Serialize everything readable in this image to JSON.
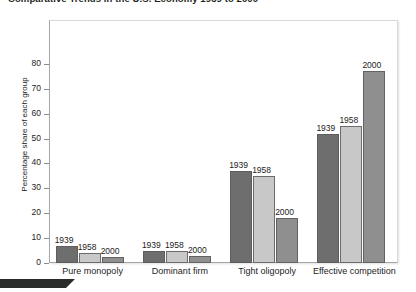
{
  "chart_data": {
    "type": "bar",
    "title": "Comparative Trends in the U.S. Economy 1939 to 2000",
    "xlabel": "",
    "ylabel": "Percentage share of each group",
    "categories": [
      "Pure monopoly",
      "Dominant firm",
      "Tight oligopoly",
      "Effective competition"
    ],
    "series": [
      {
        "name": "1939",
        "values": [
          7,
          5,
          37,
          52
        ],
        "color": "#6e6e6e"
      },
      {
        "name": "1958",
        "values": [
          4,
          5,
          35,
          55
        ],
        "color": "#c8c8c8"
      },
      {
        "name": "2000",
        "values": [
          2.5,
          3,
          18,
          77
        ],
        "color": "#8f8f8f"
      }
    ],
    "ylim": [
      0,
      85
    ],
    "yticks": [
      0,
      10,
      20,
      30,
      40,
      50,
      60,
      70,
      80
    ],
    "ytick_labels": [
      "0",
      "10",
      "20",
      "30",
      "40",
      "50",
      "60",
      "70",
      "80"
    ],
    "grid": false,
    "legend": "none",
    "data_labels": [
      [
        "1939",
        "1958",
        "2000"
      ],
      [
        "1939",
        "1958",
        "2000"
      ],
      [
        "1939",
        "1958",
        "2000"
      ],
      [
        "1939",
        "1958",
        "2000"
      ]
    ]
  },
  "colors": {
    "series_1939": "#6e6e6e",
    "series_1958": "#c8c8c8",
    "series_2000": "#8f8f8f",
    "axis": "#8c8c8c",
    "text": "#1d1d1d",
    "footer_tab": "#2b2b2b"
  }
}
